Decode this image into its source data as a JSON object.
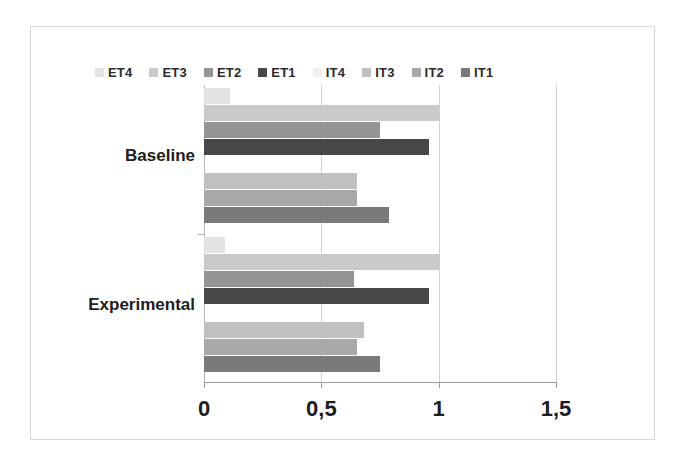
{
  "chart_data": {
    "type": "bar",
    "orientation": "horizontal",
    "title": "",
    "xlabel": "",
    "ylabel": "",
    "categories": [
      "Baseline",
      "Experimental"
    ],
    "xlim": [
      0,
      1.5
    ],
    "xticks": [
      0,
      0.5,
      1,
      1.5
    ],
    "xtick_labels": [
      "0",
      "0,5",
      "1",
      "1,5"
    ],
    "decimal_separator": ",",
    "grid": true,
    "grid_axis": "x",
    "legend_position": "top",
    "legend": [
      "ET4",
      "ET3",
      "ET2",
      "ET1",
      "IT4",
      "IT3",
      "IT2",
      "IT1"
    ],
    "series": [
      {
        "name": "ET4",
        "color": "#e3e3e3",
        "values": [
          0.11,
          0.09
        ]
      },
      {
        "name": "ET3",
        "color": "#cacaca",
        "values": [
          1.0,
          1.0
        ]
      },
      {
        "name": "ET2",
        "color": "#949494",
        "values": [
          0.75,
          0.64
        ]
      },
      {
        "name": "ET1",
        "color": "#484848",
        "values": [
          0.96,
          0.96
        ]
      },
      {
        "name": "IT4",
        "color": "#f0f0f0",
        "values": [
          0.0,
          0.0
        ]
      },
      {
        "name": "IT3",
        "color": "#c0c0c0",
        "values": [
          0.65,
          0.68
        ]
      },
      {
        "name": "IT2",
        "color": "#a8a8a8",
        "values": [
          0.65,
          0.65
        ]
      },
      {
        "name": "IT1",
        "color": "#7a7a7a",
        "values": [
          0.79,
          0.75
        ]
      }
    ]
  },
  "legend": {
    "items": [
      {
        "label": "ET4",
        "color": "#e3e3e3"
      },
      {
        "label": "ET3",
        "color": "#cacaca"
      },
      {
        "label": "ET2",
        "color": "#949494"
      },
      {
        "label": "ET1",
        "color": "#484848"
      },
      {
        "label": "IT4",
        "color": "#f0f0f0"
      },
      {
        "label": "IT3",
        "color": "#c0c0c0"
      },
      {
        "label": "IT2",
        "color": "#a8a8a8"
      },
      {
        "label": "IT1",
        "color": "#7a7a7a"
      }
    ]
  },
  "axes": {
    "x_tick_labels": [
      "0",
      "0,5",
      "1",
      "1,5"
    ],
    "category_labels": [
      "Baseline",
      "Experimental"
    ]
  },
  "colors": {
    "frame": "#d9d9d9",
    "gridline": "#d0d0d0",
    "axis": "#9a9a9a",
    "text": "#1d1d1d",
    "background": "#ffffff"
  }
}
